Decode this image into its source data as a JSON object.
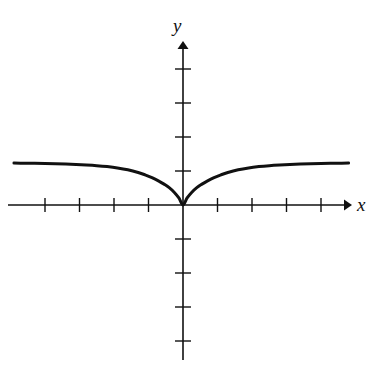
{
  "figure": {
    "background_color": "#ffffff",
    "ink_color": "#111111",
    "width": 373,
    "height": 365
  },
  "labels": {
    "x_axis": "x",
    "y_axis": "y"
  },
  "chart_data": {
    "type": "line",
    "title": "",
    "subtitle": "",
    "xlabel": "x",
    "ylabel": "y",
    "grid": false,
    "legend": null,
    "legend_position": "none",
    "axes_style": "cartesian-cross-with-arrows",
    "origin_px": [
      183,
      205
    ],
    "unit_px": {
      "x": 34.5,
      "y": 34.0
    },
    "xlim": [
      -4.9,
      4.8
    ],
    "ylim": [
      -4.7,
      4.7
    ],
    "x_ticks": [
      -4,
      -3,
      -2,
      -1,
      1,
      2,
      3,
      4
    ],
    "y_ticks": [
      -4,
      -3,
      -2,
      -1,
      1,
      2,
      3,
      4
    ],
    "x_tick_labels": [
      "",
      "",
      "",
      "",
      "",
      "",
      "",
      ""
    ],
    "y_tick_labels": [
      "",
      "",
      "",
      "",
      "",
      "",
      "",
      ""
    ],
    "asymptote_y": 1.2,
    "minimum_point": [
      0,
      0
    ],
    "series": [
      {
        "name": "curve",
        "color": "#111111",
        "line_width": 3,
        "x": [
          -4.9,
          -4.6,
          -4.3,
          -4.0,
          -3.7,
          -3.4,
          -3.1,
          -2.8,
          -2.5,
          -2.2,
          -1.9,
          -1.6,
          -1.3,
          -1.1,
          -0.9,
          -0.7,
          -0.55,
          -0.4,
          -0.25,
          -0.12,
          0.0,
          0.12,
          0.25,
          0.4,
          0.55,
          0.7,
          0.9,
          1.1,
          1.3,
          1.6,
          1.9,
          2.2,
          2.5,
          2.8,
          3.1,
          3.4,
          3.7,
          4.0,
          4.3,
          4.6,
          4.8
        ],
        "y": [
          1.233,
          1.23,
          1.226,
          1.221,
          1.214,
          1.205,
          1.194,
          1.178,
          1.158,
          1.13,
          1.091,
          1.036,
          0.957,
          0.888,
          0.805,
          0.703,
          0.614,
          0.511,
          0.37,
          0.208,
          0.0,
          0.208,
          0.37,
          0.511,
          0.614,
          0.703,
          0.805,
          0.888,
          0.957,
          1.036,
          1.091,
          1.13,
          1.158,
          1.178,
          1.194,
          1.205,
          1.214,
          1.221,
          1.226,
          1.23,
          1.232
        ]
      }
    ]
  }
}
